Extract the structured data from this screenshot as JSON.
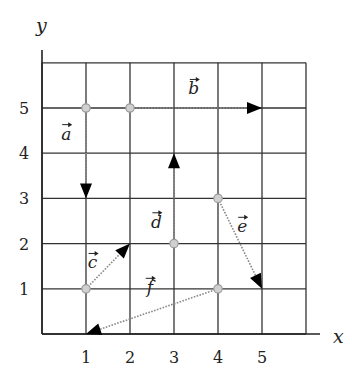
{
  "diagram": {
    "type": "vector-grid",
    "axes": {
      "x_label": "x",
      "y_label": "y",
      "x_ticks": [
        "1",
        "2",
        "3",
        "4",
        "5"
      ],
      "y_ticks": [
        "1",
        "2",
        "3",
        "4",
        "5"
      ],
      "grid_range": {
        "x": [
          0,
          6
        ],
        "y": [
          0,
          6
        ]
      }
    },
    "vectors": [
      {
        "name": "a",
        "label": "a",
        "from": [
          1,
          5
        ],
        "to": [
          1,
          3
        ],
        "label_pos": [
          0.55,
          4.3
        ]
      },
      {
        "name": "b",
        "label": "b",
        "from": [
          2,
          5
        ],
        "to": [
          5,
          5
        ],
        "label_pos": [
          3.45,
          5.3
        ]
      },
      {
        "name": "c",
        "label": "c",
        "from": [
          1,
          1
        ],
        "to": [
          2,
          2
        ],
        "label_pos": [
          1.15,
          1.45
        ]
      },
      {
        "name": "d",
        "label": "d",
        "from": [
          3,
          2
        ],
        "to": [
          3,
          4
        ],
        "label_pos": [
          2.6,
          2.35
        ]
      },
      {
        "name": "e",
        "label": "e",
        "from": [
          4,
          3
        ],
        "to": [
          5,
          1
        ],
        "label_pos": [
          4.55,
          2.25
        ]
      },
      {
        "name": "f",
        "label": "f",
        "from": [
          4,
          1
        ],
        "to": [
          1,
          0
        ],
        "label_pos": [
          2.45,
          0.9
        ]
      }
    ],
    "colors": {
      "grid": "#333333",
      "vector": "#8a8a8a",
      "arrowhead": "#000000",
      "start_point": "#9a9a9a"
    }
  }
}
